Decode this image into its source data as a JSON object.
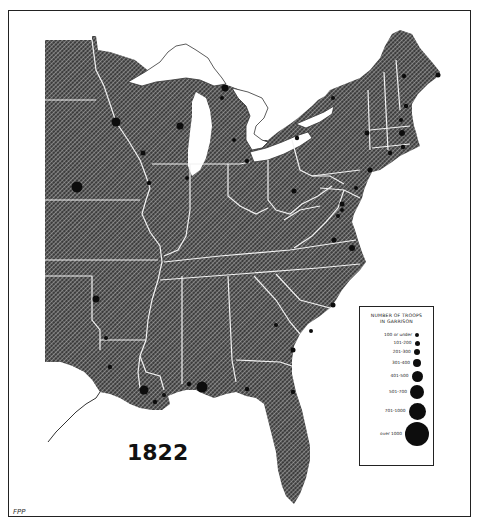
{
  "map": {
    "year": "1822",
    "credit": "FPP",
    "colors": {
      "land": "#4a4a4a",
      "hatch": "#ffffff",
      "water": "#ffffff",
      "border": "#ffffff",
      "marker": "#0d0d0d"
    }
  },
  "legend": {
    "title_line1": "NUMBER OF TROOPS",
    "title_line2": "IN GARRISON",
    "items": [
      {
        "label": "100 or under",
        "size": 4
      },
      {
        "label": "101-200",
        "size": 5
      },
      {
        "label": "201-300",
        "size": 6.5
      },
      {
        "label": "301-400",
        "size": 8
      },
      {
        "label": "401-500",
        "size": 11
      },
      {
        "label": "501-700",
        "size": 14
      },
      {
        "label": "701-1000",
        "size": 17
      },
      {
        "label": "over 1000",
        "size": 24
      }
    ]
  },
  "garrisons": [
    {
      "x": 116,
      "y": 122,
      "r": 4.5
    },
    {
      "x": 180,
      "y": 126,
      "r": 3.5
    },
    {
      "x": 143,
      "y": 153,
      "r": 2.5
    },
    {
      "x": 149,
      "y": 183,
      "r": 2.2
    },
    {
      "x": 77,
      "y": 187,
      "r": 5.5
    },
    {
      "x": 225,
      "y": 88,
      "r": 3.5
    },
    {
      "x": 222,
      "y": 98,
      "r": 2
    },
    {
      "x": 234,
      "y": 140,
      "r": 2
    },
    {
      "x": 187,
      "y": 178,
      "r": 2
    },
    {
      "x": 247,
      "y": 161,
      "r": 2.2
    },
    {
      "x": 297,
      "y": 138,
      "r": 2.2
    },
    {
      "x": 333,
      "y": 98,
      "r": 2
    },
    {
      "x": 367,
      "y": 133,
      "r": 2.5
    },
    {
      "x": 404,
      "y": 76,
      "r": 2.2
    },
    {
      "x": 438,
      "y": 75,
      "r": 2.5
    },
    {
      "x": 406,
      "y": 106,
      "r": 2.2
    },
    {
      "x": 401,
      "y": 120,
      "r": 2
    },
    {
      "x": 402,
      "y": 133,
      "r": 3
    },
    {
      "x": 403,
      "y": 147,
      "r": 2.2
    },
    {
      "x": 390,
      "y": 153,
      "r": 2.2
    },
    {
      "x": 370,
      "y": 170,
      "r": 2.5
    },
    {
      "x": 294,
      "y": 191,
      "r": 2.5
    },
    {
      "x": 356,
      "y": 188,
      "r": 2
    },
    {
      "x": 342,
      "y": 204,
      "r": 2.5
    },
    {
      "x": 342,
      "y": 210,
      "r": 2
    },
    {
      "x": 338,
      "y": 216,
      "r": 2
    },
    {
      "x": 334,
      "y": 240,
      "r": 2.5
    },
    {
      "x": 352,
      "y": 248,
      "r": 3
    },
    {
      "x": 333,
      "y": 305,
      "r": 2.5
    },
    {
      "x": 276,
      "y": 325,
      "r": 2
    },
    {
      "x": 311,
      "y": 331,
      "r": 2
    },
    {
      "x": 293,
      "y": 350,
      "r": 2.5
    },
    {
      "x": 293,
      "y": 392,
      "r": 2.2
    },
    {
      "x": 247,
      "y": 389,
      "r": 2.2
    },
    {
      "x": 202,
      "y": 387,
      "r": 5.5
    },
    {
      "x": 189,
      "y": 384,
      "r": 2.2
    },
    {
      "x": 144,
      "y": 390,
      "r": 4.5
    },
    {
      "x": 164,
      "y": 395,
      "r": 2
    },
    {
      "x": 96,
      "y": 299,
      "r": 3.5
    },
    {
      "x": 106,
      "y": 338,
      "r": 2
    },
    {
      "x": 110,
      "y": 367,
      "r": 2.2
    },
    {
      "x": 155,
      "y": 402,
      "r": 2.2
    }
  ]
}
